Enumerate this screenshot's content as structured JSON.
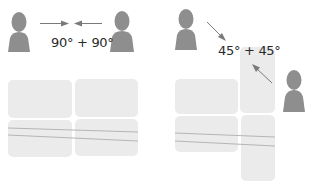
{
  "diagram": {
    "left_panel": {
      "label": "90° + 90°",
      "description": "Two people facing each other head-on across a 2x2 tile grid"
    },
    "right_panel": {
      "label": "45° + 45°",
      "description": "Two people approaching diagonally across an offset tile arrangement"
    },
    "icons": [
      "person-icon",
      "arrow-right-icon",
      "arrow-left-icon",
      "arrow-diagonal-down-right-icon",
      "arrow-diagonal-up-left-icon"
    ],
    "colors": {
      "person": "#8e8e8e",
      "tile": "#ebebeb",
      "arrow": "#7a7a7a",
      "line": "#b5b5b5",
      "text": "#2a2a2a"
    }
  }
}
